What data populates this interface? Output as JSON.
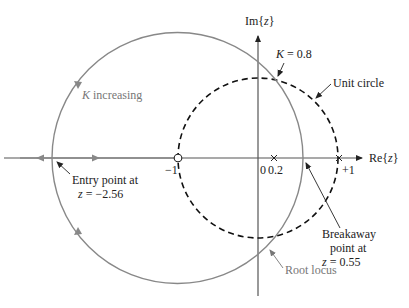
{
  "figure": {
    "type": "root-locus-z-plane",
    "axes": {
      "real_label_prefix": "Re{",
      "real_label_var": "z",
      "real_label_suffix": "}",
      "imag_label_prefix": "Im{",
      "imag_label_var": "z",
      "imag_label_suffix": "}"
    },
    "ticks": {
      "minus_one": "−1",
      "zero": "0",
      "point_two": "0.2",
      "plus_one": "+1"
    },
    "annotations": {
      "k_increasing_var": "K",
      "k_increasing_text": " increasing",
      "k_value_var": "K",
      "k_value_text": " = 0.8",
      "unit_circle": "Unit circle",
      "entry_line1": "Entry point at",
      "entry_line2_var": "z",
      "entry_line2_text": " = −2.56",
      "breakaway_line1": "Breakaway",
      "breakaway_line2": "point at",
      "breakaway_line3_var": "z",
      "breakaway_line3_text": " = 0.55",
      "root_locus": "Root locus"
    },
    "poles": [
      0.2,
      1
    ],
    "zeros": [
      -1
    ],
    "breakaway_point": 0.55,
    "entry_point": -2.56,
    "k_at_unit_circle": 0.8,
    "colors": {
      "locus": "#808080",
      "axes": "#555555",
      "unit_circle": "#111111",
      "text": "#222222",
      "gray_text": "#777777"
    }
  }
}
